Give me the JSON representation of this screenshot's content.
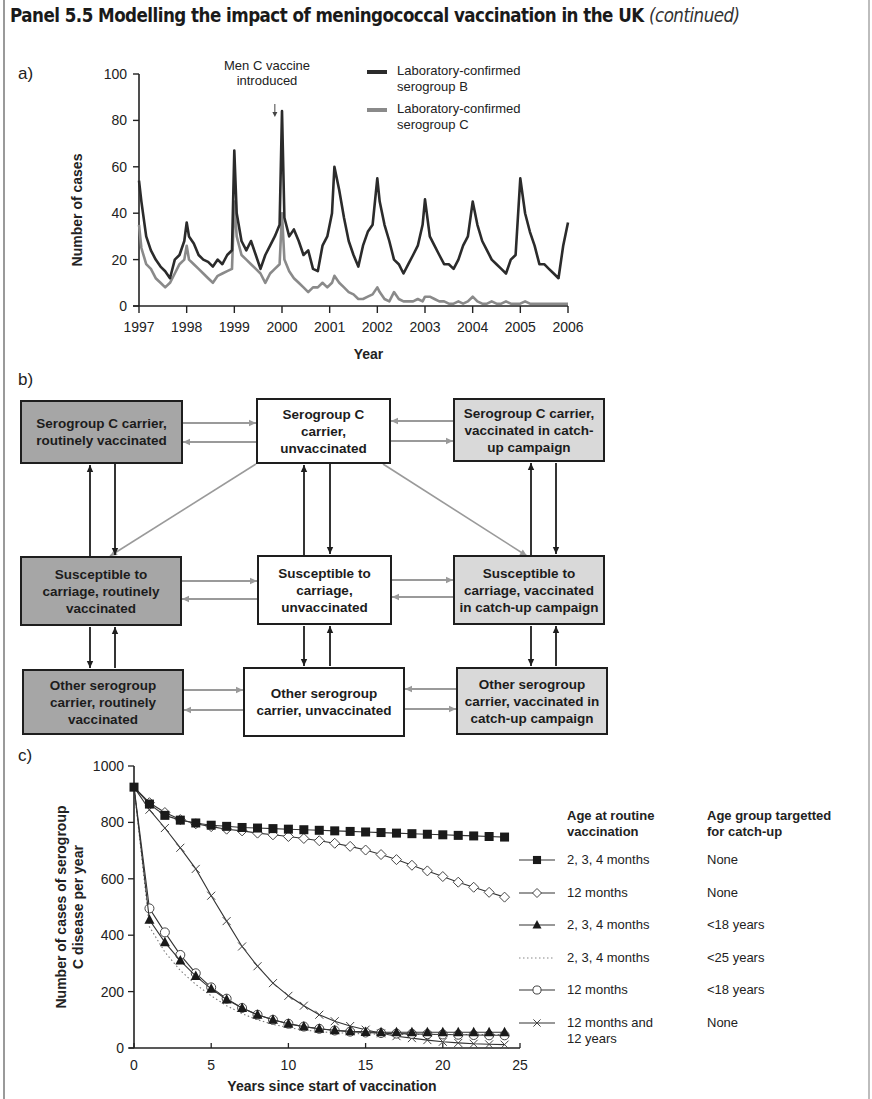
{
  "header": {
    "title": "Panel 5.5  Modelling the impact of meningococcal vaccination in the UK",
    "continued": "(continued)"
  },
  "panels": {
    "a_label": "a)",
    "b_label": "b)",
    "c_label": "c)"
  },
  "diagram": {
    "boxes": [
      {
        "id": "c_routine",
        "label": "Serogroup C carrier, routinely vaccinated",
        "fill": "dark"
      },
      {
        "id": "c_unvacc",
        "label": "Serogroup C carrier, unvaccinated",
        "fill": "white"
      },
      {
        "id": "c_catchup",
        "label": "Serogroup C carrier, vaccinated in catch-up campaign",
        "fill": "light"
      },
      {
        "id": "s_routine",
        "label": "Susceptible to carriage, routinely vaccinated",
        "fill": "dark"
      },
      {
        "id": "s_unvacc",
        "label": "Susceptible to carriage, unvaccinated",
        "fill": "white"
      },
      {
        "id": "s_catchup",
        "label": "Susceptible to carriage, vaccinated in catch-up campaign",
        "fill": "light"
      },
      {
        "id": "o_routine",
        "label": "Other serogroup carrier, routinely vaccinated",
        "fill": "dark"
      },
      {
        "id": "o_unvacc",
        "label": "Other serogroup carrier, unvaccinated",
        "fill": "white"
      },
      {
        "id": "o_catchup",
        "label": "Other serogroup carrier, vaccinated in catch-up campaign",
        "fill": "light"
      }
    ]
  },
  "chart_data": [
    {
      "type": "line",
      "title": "",
      "xlabel": "Year",
      "ylabel": "Number of cases",
      "xlim": [
        1997,
        2006
      ],
      "ylim": [
        0,
        100
      ],
      "xticks": [
        "1997",
        "1998",
        "1999",
        "2000",
        "2001",
        "2002",
        "2003",
        "2004",
        "2005",
        "2006"
      ],
      "yticks": [
        0,
        20,
        40,
        60,
        80,
        100
      ],
      "grid": false,
      "legend_position": "top-right",
      "annotation": {
        "text": "Men C vaccine introduced",
        "x": 1999.85,
        "arrow": true
      },
      "series": [
        {
          "name": "Laboratory-confirmed serogroup B",
          "color": "#2b2b2b",
          "x": [
            1997.0,
            1997.05,
            1997.15,
            1997.25,
            1997.35,
            1997.45,
            1997.55,
            1997.65,
            1997.75,
            1997.85,
            1997.95,
            1998.0,
            1998.05,
            1998.15,
            1998.25,
            1998.35,
            1998.45,
            1998.55,
            1998.65,
            1998.75,
            1998.85,
            1998.95,
            1999.0,
            1999.05,
            1999.15,
            1999.25,
            1999.35,
            1999.45,
            1999.55,
            1999.65,
            1999.75,
            1999.85,
            1999.95,
            2000.0,
            2000.05,
            2000.15,
            2000.25,
            2000.35,
            2000.45,
            2000.55,
            2000.65,
            2000.75,
            2000.85,
            2000.95,
            2001.05,
            2001.1,
            2001.2,
            2001.3,
            2001.4,
            2001.5,
            2001.6,
            2001.7,
            2001.8,
            2001.9,
            2002.0,
            2002.05,
            2002.15,
            2002.25,
            2002.35,
            2002.45,
            2002.55,
            2002.65,
            2002.75,
            2002.85,
            2002.95,
            2003.0,
            2003.1,
            2003.2,
            2003.3,
            2003.4,
            2003.5,
            2003.6,
            2003.7,
            2003.8,
            2003.9,
            2004.0,
            2004.1,
            2004.2,
            2004.3,
            2004.4,
            2004.5,
            2004.6,
            2004.7,
            2004.8,
            2004.9,
            2005.0,
            2005.1,
            2005.2,
            2005.3,
            2005.4,
            2005.5,
            2005.6,
            2005.7,
            2005.8,
            2005.9,
            2006.0
          ],
          "y": [
            54,
            45,
            30,
            24,
            20,
            17,
            15,
            12,
            20,
            22,
            28,
            36,
            30,
            27,
            22,
            20,
            19,
            17,
            20,
            18,
            22,
            24,
            67,
            40,
            28,
            24,
            28,
            22,
            16,
            22,
            26,
            30,
            35,
            84,
            38,
            30,
            33,
            28,
            22,
            24,
            16,
            15,
            26,
            30,
            40,
            60,
            50,
            38,
            28,
            22,
            17,
            26,
            32,
            35,
            55,
            45,
            35,
            28,
            20,
            18,
            14,
            18,
            22,
            26,
            35,
            46,
            30,
            26,
            22,
            18,
            18,
            16,
            20,
            26,
            30,
            45,
            35,
            28,
            24,
            20,
            18,
            16,
            14,
            20,
            22,
            55,
            40,
            32,
            26,
            18,
            18,
            16,
            14,
            12,
            26,
            36
          ]
        },
        {
          "name": "Laboratory-confirmed serogroup C",
          "color": "#8a8a8a",
          "x": [
            1997.0,
            1997.05,
            1997.15,
            1997.25,
            1997.35,
            1997.45,
            1997.55,
            1997.65,
            1997.75,
            1997.85,
            1997.95,
            1998.0,
            1998.05,
            1998.15,
            1998.25,
            1998.35,
            1998.45,
            1998.55,
            1998.65,
            1998.75,
            1998.85,
            1998.95,
            1999.0,
            1999.05,
            1999.15,
            1999.25,
            1999.35,
            1999.45,
            1999.55,
            1999.65,
            1999.75,
            1999.85,
            1999.95,
            2000.0,
            2000.05,
            2000.15,
            2000.25,
            2000.35,
            2000.45,
            2000.55,
            2000.65,
            2000.75,
            2000.85,
            2000.95,
            2001.05,
            2001.1,
            2001.2,
            2001.3,
            2001.4,
            2001.5,
            2001.6,
            2001.7,
            2001.8,
            2001.9,
            2002.0,
            2002.05,
            2002.15,
            2002.25,
            2002.35,
            2002.45,
            2002.55,
            2002.65,
            2002.75,
            2002.85,
            2002.95,
            2003.0,
            2003.1,
            2003.2,
            2003.3,
            2003.4,
            2003.5,
            2003.6,
            2003.7,
            2003.8,
            2003.9,
            2004.0,
            2004.1,
            2004.2,
            2004.3,
            2004.4,
            2004.5,
            2004.6,
            2004.7,
            2004.8,
            2004.9,
            2005.0,
            2005.1,
            2005.2,
            2005.3,
            2005.4,
            2005.5,
            2005.6,
            2005.7,
            2005.8,
            2005.9,
            2006.0
          ],
          "y": [
            35,
            25,
            18,
            16,
            12,
            10,
            8,
            10,
            14,
            18,
            20,
            26,
            20,
            18,
            16,
            14,
            12,
            10,
            13,
            14,
            15,
            16,
            45,
            30,
            22,
            20,
            18,
            16,
            14,
            10,
            14,
            16,
            18,
            40,
            20,
            15,
            12,
            10,
            8,
            6,
            8,
            8,
            10,
            8,
            10,
            13,
            10,
            8,
            6,
            5,
            3,
            3,
            4,
            5,
            8,
            6,
            3,
            2,
            6,
            3,
            2,
            2,
            2,
            3,
            2,
            4,
            4,
            3,
            2,
            2,
            1,
            1,
            2,
            1,
            2,
            4,
            2,
            1,
            1,
            2,
            1,
            1,
            2,
            1,
            1,
            1,
            2,
            1,
            1,
            1,
            1,
            1,
            1,
            1,
            1,
            1
          ]
        }
      ]
    },
    {
      "type": "line",
      "title": "",
      "xlabel": "Years since start of vaccination",
      "ylabel": "Number of cases of serogroup C disease per year",
      "xlim": [
        0,
        25
      ],
      "ylim": [
        0,
        1000
      ],
      "xticks": [
        0,
        5,
        10,
        15,
        20,
        25
      ],
      "yticks": [
        0,
        200,
        400,
        600,
        800,
        1000
      ],
      "grid": false,
      "legend_position": "right",
      "legend_headers": [
        "Age at routine vaccination",
        "Age group targetted for catch-up"
      ],
      "x": [
        0,
        1,
        2,
        3,
        4,
        5,
        6,
        7,
        8,
        9,
        10,
        11,
        12,
        13,
        14,
        15,
        16,
        17,
        18,
        19,
        20,
        21,
        22,
        23,
        24
      ],
      "series": [
        {
          "name": "2, 3, 4 months / None",
          "routine": "2, 3, 4 months",
          "catchup": "None",
          "marker": "filled-square",
          "style": "solid",
          "values": [
            925,
            865,
            825,
            808,
            798,
            790,
            786,
            782,
            780,
            778,
            776,
            774,
            772,
            770,
            768,
            766,
            764,
            762,
            760,
            758,
            756,
            754,
            752,
            750,
            748
          ]
        },
        {
          "name": "12 months / None",
          "routine": "12 months",
          "catchup": "None",
          "marker": "open-diamond",
          "style": "solid",
          "values": [
            925,
            870,
            835,
            810,
            795,
            785,
            776,
            770,
            762,
            756,
            750,
            743,
            735,
            726,
            715,
            702,
            686,
            668,
            648,
            628,
            608,
            588,
            570,
            552,
            535
          ]
        },
        {
          "name": "2, 3, 4 months / <18 years",
          "routine": "2, 3, 4 months",
          "catchup": "<18 years",
          "marker": "filled-triangle",
          "style": "solid",
          "values": [
            925,
            455,
            375,
            310,
            255,
            210,
            172,
            142,
            118,
            100,
            86,
            76,
            68,
            63,
            59,
            57,
            56,
            56,
            56,
            56,
            56,
            56,
            56,
            56,
            56
          ]
        },
        {
          "name": "2, 3, 4 months / <25 years",
          "routine": "2, 3, 4 months",
          "catchup": "<25 years",
          "marker": "none",
          "style": "dotted",
          "values": [
            925,
            430,
            340,
            275,
            225,
            185,
            150,
            122,
            100,
            84,
            72,
            64,
            58,
            54,
            52,
            50,
            49,
            48,
            48,
            48,
            48,
            48,
            48,
            48,
            48
          ]
        },
        {
          "name": "12 months / <18 years",
          "routine": "12 months",
          "catchup": "<18 years",
          "marker": "open-circle",
          "style": "solid",
          "values": [
            925,
            495,
            410,
            330,
            265,
            215,
            175,
            142,
            118,
            100,
            86,
            76,
            68,
            62,
            58,
            55,
            53,
            51,
            50,
            49,
            48,
            47,
            46,
            45,
            45
          ]
        },
        {
          "name": "12 months and 12 years / None",
          "routine": "12 months and 12 years",
          "catchup": "None",
          "marker": "x",
          "style": "solid",
          "values": [
            925,
            845,
            780,
            710,
            635,
            540,
            450,
            360,
            290,
            230,
            185,
            150,
            118,
            95,
            78,
            65,
            52,
            42,
            35,
            28,
            22,
            18,
            15,
            13,
            12
          ]
        }
      ]
    }
  ]
}
